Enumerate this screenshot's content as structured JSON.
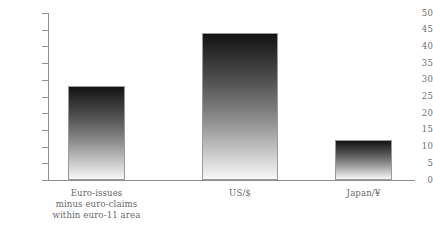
{
  "chart_data": {
    "type": "bar",
    "title": "",
    "subtitle": "",
    "xlabel": "",
    "ylabel": "",
    "ylim": [
      0,
      50
    ],
    "yticks": [
      0,
      5,
      10,
      15,
      20,
      25,
      30,
      35,
      40,
      45,
      50
    ],
    "ytick_labels": [
      "0",
      "5",
      "10",
      "15",
      "20",
      "25",
      "30",
      "35",
      "40",
      "45",
      "50"
    ],
    "grid": false,
    "legend": null,
    "categories": [
      "Euro-issues minus euro-claims within euro-11 area",
      "US/$",
      "Japan/¥"
    ],
    "category_lines": [
      [
        "Euro-issues",
        "minus euro-claims",
        "within euro-11 area"
      ],
      [
        "US/$"
      ],
      [
        "Japan/¥"
      ]
    ],
    "values": [
      28,
      44,
      12
    ],
    "bar_style": {
      "gradient_top": "#131313",
      "gradient_bottom": "#f6f6f6",
      "border": "#9a9a9a"
    },
    "axis_color": "#8f8f8f",
    "text_color": "#6a6a6a",
    "background": "#ffffff"
  }
}
